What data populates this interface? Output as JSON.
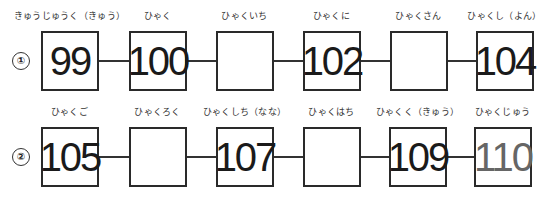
{
  "rows": [
    {
      "marker": "①",
      "cells": [
        {
          "label": "きゅうじゅうく（きゅう）",
          "value": "99"
        },
        {
          "label": "ひゃく",
          "value": "100"
        },
        {
          "label": "ひゃくいち",
          "value": ""
        },
        {
          "label": "ひゃくに",
          "value": "102"
        },
        {
          "label": "ひゃくさん",
          "value": ""
        },
        {
          "label": "ひゃくし（よん）",
          "value": "104"
        }
      ]
    },
    {
      "marker": "②",
      "cells": [
        {
          "label": "ひゃくご",
          "value": "105"
        },
        {
          "label": "ひゃくろく",
          "value": ""
        },
        {
          "label": "ひゃくしち（なな）",
          "value": "107"
        },
        {
          "label": "ひゃくはち",
          "value": ""
        },
        {
          "label": "ひゃくく（きゅう）",
          "value": "109"
        },
        {
          "label": "ひゃくじゅう",
          "value": "110"
        }
      ]
    }
  ]
}
